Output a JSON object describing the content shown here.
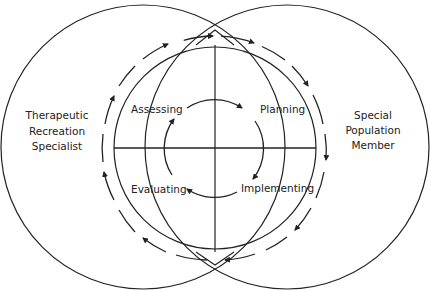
{
  "diagram": {
    "left_circle_label": [
      "Therapeutic",
      "Recreation",
      "Specialist"
    ],
    "right_circle_label": [
      "Special",
      "Population",
      "Member"
    ],
    "quadrants": {
      "top_left": "Assessing",
      "top_right": "Planning",
      "bottom_right": "Implementing",
      "bottom_left": "Evaluating"
    },
    "inner_cycle_direction": "clockwise",
    "outer_dashed_cycle_direction": "clockwise",
    "colors": {
      "stroke": "#222222",
      "background": "#ffffff"
    }
  }
}
